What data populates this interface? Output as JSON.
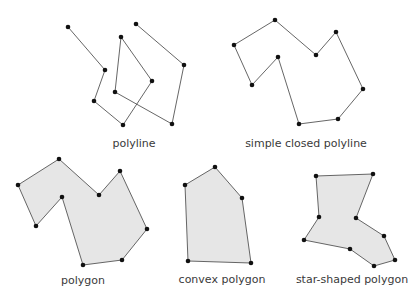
{
  "diagram": {
    "figures": [
      {
        "id": "polyline",
        "label": "polyline",
        "closed": false,
        "filled": false,
        "label_pos": [
          134,
          147
        ],
        "points": [
          [
            68,
            27
          ],
          [
            105,
            70
          ],
          [
            94,
            101
          ],
          [
            123,
            125
          ],
          [
            152,
            81
          ],
          [
            121,
            37
          ],
          [
            115,
            92
          ],
          [
            172,
            124
          ],
          [
            184,
            65
          ],
          [
            136,
            24
          ]
        ]
      },
      {
        "id": "simple-closed-polyline",
        "label": "simple closed polyline",
        "closed": true,
        "filled": false,
        "label_pos": [
          306,
          147
        ],
        "points": [
          [
            234,
            45
          ],
          [
            275,
            20
          ],
          [
            316,
            55
          ],
          [
            336,
            32
          ],
          [
            363,
            89
          ],
          [
            338,
            119
          ],
          [
            299,
            124
          ],
          [
            278,
            57
          ],
          [
            252,
            85
          ]
        ]
      },
      {
        "id": "polygon",
        "label": "polygon",
        "closed": true,
        "filled": true,
        "label_pos": [
          83,
          284
        ],
        "points": [
          [
            18,
            185
          ],
          [
            59,
            159
          ],
          [
            99,
            195
          ],
          [
            120,
            171
          ],
          [
            147,
            229
          ],
          [
            122,
            260
          ],
          [
            83,
            265
          ],
          [
            62,
            197
          ],
          [
            36,
            226
          ]
        ]
      },
      {
        "id": "convex-polygon",
        "label": "convex polygon",
        "closed": true,
        "filled": true,
        "label_pos": [
          222,
          283
        ],
        "points": [
          [
            215,
            167
          ],
          [
            242,
            198
          ],
          [
            251,
            263
          ],
          [
            188,
            261
          ],
          [
            185,
            185
          ]
        ]
      },
      {
        "id": "star-shaped-polygon",
        "label": "star-shaped polygon",
        "closed": true,
        "filled": true,
        "label_pos": [
          352,
          283
        ],
        "points": [
          [
            316,
            176
          ],
          [
            373,
            174
          ],
          [
            356,
            218
          ],
          [
            384,
            236
          ],
          [
            395,
            260
          ],
          [
            374,
            266
          ],
          [
            350,
            249
          ],
          [
            304,
            240
          ],
          [
            319,
            217
          ]
        ]
      }
    ],
    "colors": {
      "fill": "#e6e6e6",
      "stroke": "#555555",
      "vertex": "#111111",
      "label": "#3a3a3a"
    }
  }
}
